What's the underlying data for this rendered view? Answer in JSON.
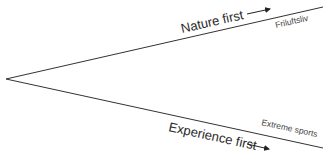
{
  "diagram": {
    "upper_branch": {
      "label": "Nature first",
      "endpoint_label": "Friluftsliv"
    },
    "lower_branch": {
      "label": "Experience first",
      "endpoint_label": "Extreme sports"
    },
    "colors": {
      "line": "#333333",
      "text": "#2a2a2a",
      "small_text": "#444444"
    }
  }
}
